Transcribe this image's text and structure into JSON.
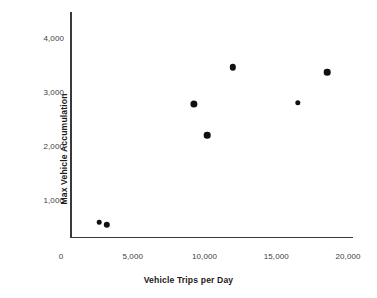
{
  "chart_data": {
    "type": "scatter",
    "title": "",
    "xlabel": "Vehicle Trips per Day",
    "ylabel": "Max Vehicle Accumulation",
    "xlim": [
      0,
      20000
    ],
    "ylim": [
      0,
      4400
    ],
    "grid": false,
    "legend": null,
    "xticks": [
      {
        "value": 0,
        "label": "0"
      },
      {
        "value": 5000,
        "label": "5,000"
      },
      {
        "value": 10000,
        "label": "10,000"
      },
      {
        "value": 15000,
        "label": "15,000"
      },
      {
        "value": 20000,
        "label": "20,000"
      }
    ],
    "yticks": [
      {
        "value": 1000,
        "label": "1,000"
      },
      {
        "value": 2000,
        "label": "2,000"
      },
      {
        "value": 3000,
        "label": "3,000"
      },
      {
        "value": 4000,
        "label": "4,000"
      }
    ],
    "marker_color": "#111111",
    "axis_color": "#3a3a3a",
    "points": [
      {
        "x": 2650,
        "y": 590,
        "r": 2.3
      },
      {
        "x": 3200,
        "y": 540,
        "r": 3.2
      },
      {
        "x": 9270,
        "y": 2780,
        "r": 3.6
      },
      {
        "x": 10170,
        "y": 2200,
        "r": 3.3
      },
      {
        "x": 11990,
        "y": 3460,
        "r": 3.2
      },
      {
        "x": 16520,
        "y": 2800,
        "r": 2.7
      },
      {
        "x": 18540,
        "y": 3370,
        "r": 3.3
      }
    ]
  }
}
